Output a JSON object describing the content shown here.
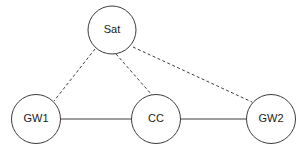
{
  "diagram": {
    "background_color": "#ffffff",
    "stroke_color": "#3c3c3c",
    "label_color": "#1a1a1a",
    "nodes": [
      {
        "id": "sat",
        "label": "Sat",
        "cx": 112,
        "cy": 30,
        "r": 24.0,
        "shape": "circle"
      },
      {
        "id": "gw1",
        "label": "GW1",
        "cx": 36,
        "cy": 119,
        "r": 24.5,
        "shape": "circle"
      },
      {
        "id": "cc",
        "label": "CC",
        "cx": 156,
        "cy": 119,
        "r": 24.5,
        "shape": "circle"
      },
      {
        "id": "gw2",
        "label": "GW2",
        "cx": 271,
        "cy": 119,
        "r": 24.5,
        "shape": "circle"
      }
    ],
    "edges": [
      {
        "id": "sat-gw1",
        "from": "sat",
        "to": "gw1",
        "style": "dashed",
        "x1": 95,
        "y1": 49,
        "x2": 54,
        "y2": 101
      },
      {
        "id": "sat-cc",
        "from": "sat",
        "to": "cc",
        "style": "dashed",
        "x1": 116,
        "y1": 54,
        "x2": 152,
        "y2": 95
      },
      {
        "id": "sat-gw2",
        "from": "sat",
        "to": "gw2",
        "style": "dashed",
        "x1": 133,
        "y1": 47,
        "x2": 252,
        "y2": 102
      },
      {
        "id": "gw1-cc",
        "from": "gw1",
        "to": "cc",
        "style": "solid",
        "x1": 61,
        "y1": 119,
        "x2": 131,
        "y2": 119
      },
      {
        "id": "cc-gw2",
        "from": "cc",
        "to": "gw2",
        "style": "solid",
        "x1": 181,
        "y1": 119,
        "x2": 246,
        "y2": 119
      }
    ]
  }
}
